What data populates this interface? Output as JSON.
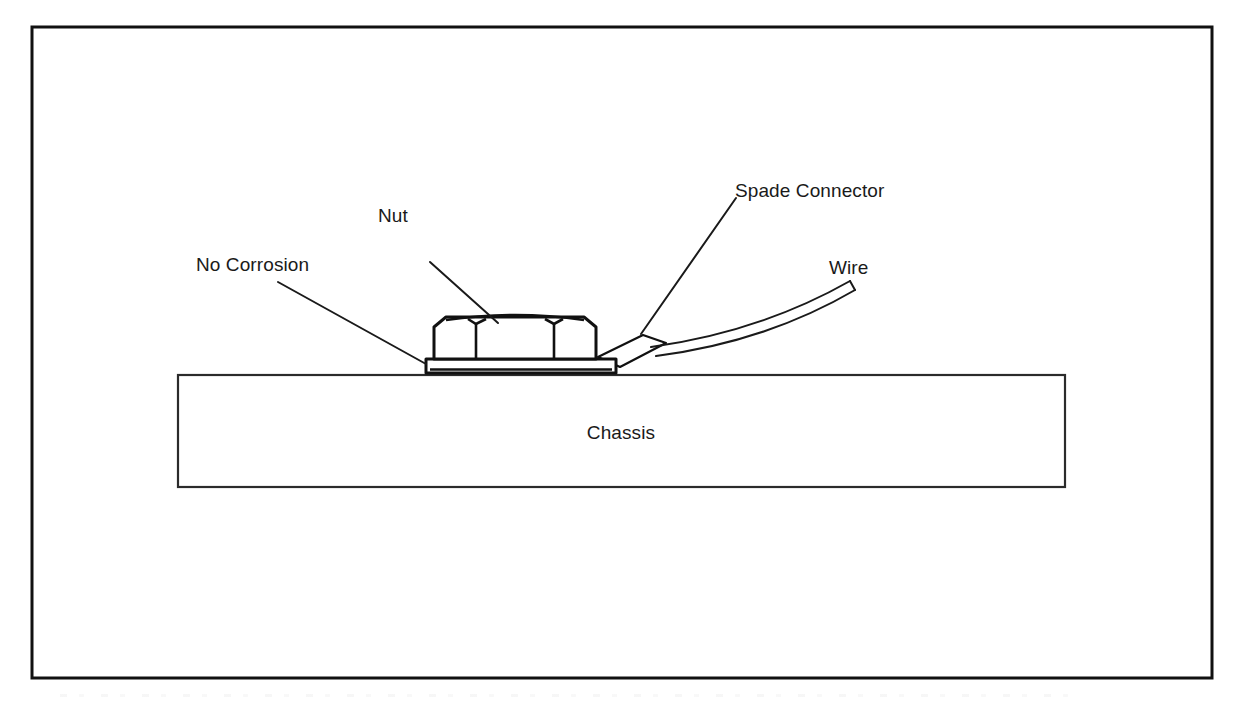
{
  "figure": {
    "type": "technical-illustration",
    "background_color": "#ffffff",
    "line_color": "#111111",
    "text_color": "#1a1a1a",
    "border": {
      "present": true,
      "x": 32,
      "y": 27,
      "width": 1180,
      "height": 651
    },
    "labels": {
      "no_corrosion": "No Corrosion",
      "nut": "Nut",
      "spade_connector": "Spade Connector",
      "wire": "Wire",
      "chassis": "Chassis"
    },
    "parts": {
      "chassis": {
        "name": "Chassis",
        "shape": "rectangle",
        "x": 178,
        "y": 375,
        "width": 887,
        "height": 112
      },
      "washer": {
        "name": "Washer / flat plate",
        "shape": "thin-bar",
        "x": 426,
        "y": 359,
        "width": 190,
        "height": 14
      },
      "nut": {
        "name": "Hex nut",
        "shape": "hex-side-view",
        "x": 434,
        "y": 316,
        "width": 162,
        "height": 44
      },
      "spade_connector": {
        "name": "Spade connector",
        "shape": "parallelogram",
        "angle_deg": -28
      },
      "wire": {
        "name": "Wire",
        "shape": "curved-double-line",
        "start": [
          648,
          356
        ],
        "end": [
          850,
          283
        ]
      }
    },
    "leaders": [
      {
        "label": "No Corrosion",
        "from": [
          278,
          282
        ],
        "to": [
          426,
          364
        ]
      },
      {
        "label": "Nut",
        "from": [
          430,
          262
        ],
        "to": [
          498,
          323
        ]
      },
      {
        "label": "Spade Connector",
        "from": [
          736,
          198
        ],
        "to": [
          641,
          334
        ]
      }
    ],
    "label_positions": {
      "no_corrosion": {
        "x": 196,
        "y": 271
      },
      "nut": {
        "x": 378,
        "y": 222
      },
      "spade_connector": {
        "x": 735,
        "y": 197
      },
      "wire": {
        "x": 829,
        "y": 274
      },
      "chassis": {
        "x": 621,
        "y": 439
      }
    }
  }
}
